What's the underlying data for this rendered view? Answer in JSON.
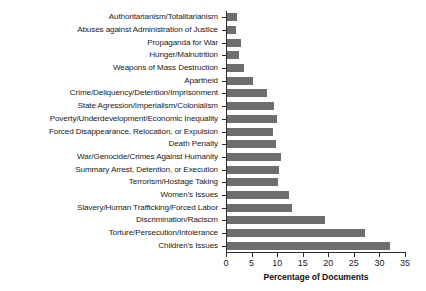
{
  "chart_data": {
    "type": "bar",
    "orientation": "horizontal",
    "title": "",
    "xlabel": "Percentage of Documents",
    "ylabel": "",
    "xlim": [
      0,
      35
    ],
    "xticks": [
      0,
      5,
      10,
      15,
      20,
      25,
      30,
      35
    ],
    "grid": false,
    "legend": null,
    "bar_color": "#6e6e6e",
    "categories": [
      "Authoritarianism/Totalitarianism",
      "Abuses against Administration of Justice",
      "Propaganda for War",
      "Hunger/Malnutrition",
      "Weapons of Mass Destruction",
      "Apartheid",
      "Crime/Deliquency/Detention/Imprisonment",
      "State Agression/Imperialism/Colonialism",
      "Poverty/Underdevelopment/Economic Inequality",
      "Forced Disappearance, Relocation, or Expulsion",
      "Death Penalty",
      "War/Genocide/Crimes Against Humanity",
      "Summary Arrest, Detention, or Execution",
      "Terrorism/Hostage Taking",
      "Women's Issues",
      "Slavery/Human Trafficking/Forced Labor",
      "Discrimination/Raciscm",
      "Torture/Persecution/Intolerance",
      "Children's Issues"
    ],
    "values": [
      2.1,
      1.9,
      2.9,
      2.5,
      3.6,
      5.3,
      8.1,
      9.4,
      10.0,
      9.1,
      9.8,
      10.7,
      10.4,
      10.2,
      12.4,
      13.0,
      19.3,
      27.1,
      32.1
    ]
  }
}
